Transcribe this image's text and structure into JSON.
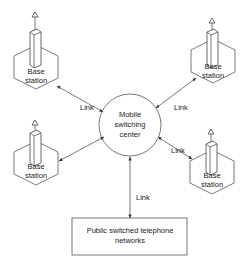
{
  "diagram": {
    "center": {
      "label_lines": [
        "Mobile",
        "switching",
        "center"
      ]
    },
    "base_stations": [
      {
        "id": "top-left",
        "label_lines": [
          "Base",
          "station"
        ]
      },
      {
        "id": "top-right",
        "label_lines": [
          "Base",
          "station"
        ]
      },
      {
        "id": "bottom-left",
        "label_lines": [
          "Base",
          "station"
        ]
      },
      {
        "id": "bottom-right",
        "label_lines": [
          "Base",
          "station"
        ]
      }
    ],
    "pstn": {
      "label_lines": [
        "Public switched telephone",
        "networks"
      ]
    },
    "links": [
      {
        "from": "top-left",
        "to": "center",
        "label": "Link"
      },
      {
        "from": "top-right",
        "to": "center",
        "label": "Link"
      },
      {
        "from": "bottom-left",
        "to": "center",
        "label": ""
      },
      {
        "from": "bottom-right",
        "to": "center",
        "label": "Link"
      },
      {
        "from": "center",
        "to": "pstn",
        "label": "Link"
      }
    ],
    "colors": {
      "line": "#555555",
      "text": "#222222",
      "background": "#ffffff"
    }
  }
}
